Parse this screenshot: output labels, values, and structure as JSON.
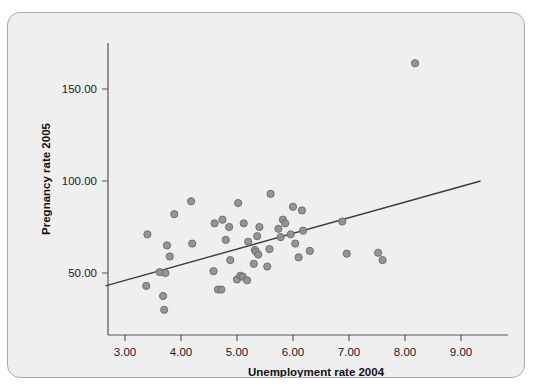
{
  "figure": {
    "ghost_text": "",
    "background_color": "#efefef",
    "border_color": "#a9a9a9",
    "marker_color": "#8f8f8f",
    "line_color": "#3c3c3c",
    "axis_color": "#555555"
  },
  "chart_data": {
    "type": "scatter",
    "title": "",
    "xlabel": "Unemployment rate 2004",
    "ylabel": "Pregnancy rate 2005",
    "xlim": [
      2.6,
      9.4
    ],
    "ylim": [
      18,
      178
    ],
    "xticks": [
      3,
      4,
      5,
      6,
      7,
      8,
      9
    ],
    "xtick_labels": [
      "3.00",
      "4.00",
      "5.00",
      "6.00",
      "7.00",
      "8.00",
      "9.00"
    ],
    "yticks": [
      50,
      100,
      150
    ],
    "ytick_labels": [
      "50.00",
      "100.00",
      "150.00"
    ],
    "grid": false,
    "legend": false,
    "series": [
      {
        "name": "observations",
        "marker": "circle",
        "color": "#8f8f8f",
        "points": [
          [
            3.4,
            71.0
          ],
          [
            3.38,
            43.0
          ],
          [
            3.62,
            50.5
          ],
          [
            3.68,
            37.5
          ],
          [
            3.7,
            30.0
          ],
          [
            3.72,
            50.0
          ],
          [
            3.75,
            65.0
          ],
          [
            3.8,
            59.0
          ],
          [
            3.88,
            82.0
          ],
          [
            4.18,
            89.0
          ],
          [
            4.2,
            66.0
          ],
          [
            4.58,
            51.0
          ],
          [
            4.6,
            77.0
          ],
          [
            4.66,
            41.0
          ],
          [
            4.72,
            41.0
          ],
          [
            4.74,
            79.0
          ],
          [
            4.8,
            68.0
          ],
          [
            4.86,
            75.0
          ],
          [
            4.88,
            57.0
          ],
          [
            5.0,
            46.5
          ],
          [
            5.02,
            88.0
          ],
          [
            5.06,
            48.5
          ],
          [
            5.1,
            48.0
          ],
          [
            5.12,
            77.0
          ],
          [
            5.18,
            46.0
          ],
          [
            5.2,
            67.0
          ],
          [
            5.3,
            55.0
          ],
          [
            5.32,
            62.5
          ],
          [
            5.34,
            61.5
          ],
          [
            5.36,
            70.0
          ],
          [
            5.38,
            60.0
          ],
          [
            5.4,
            75.0
          ],
          [
            5.54,
            53.5
          ],
          [
            5.58,
            63.0
          ],
          [
            5.6,
            93.0
          ],
          [
            5.74,
            74.0
          ],
          [
            5.78,
            69.5
          ],
          [
            5.82,
            79.0
          ],
          [
            5.86,
            77.0
          ],
          [
            5.96,
            71.0
          ],
          [
            6.0,
            86.0
          ],
          [
            6.04,
            66.0
          ],
          [
            6.1,
            58.5
          ],
          [
            6.16,
            84.0
          ],
          [
            6.18,
            73.0
          ],
          [
            6.3,
            62.0
          ],
          [
            6.88,
            78.0
          ],
          [
            6.96,
            60.5
          ],
          [
            7.52,
            61.0
          ],
          [
            7.6,
            57.0
          ],
          [
            8.18,
            164.0
          ]
        ]
      }
    ],
    "fit_line": {
      "name": "linear-fit",
      "color": "#3c3c3c",
      "x_start": 2.65,
      "y_start": 43.0,
      "x_end": 9.35,
      "y_end": 100.0
    }
  }
}
